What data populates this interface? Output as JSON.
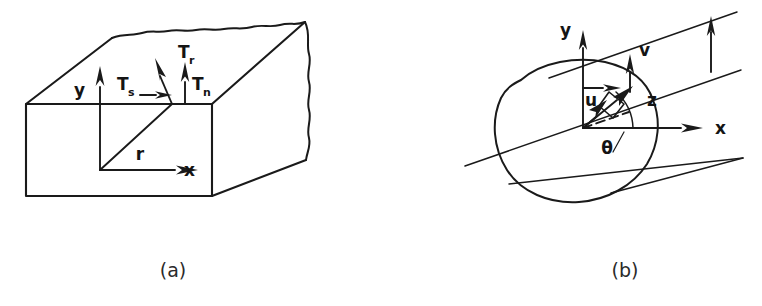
{
  "figure": {
    "background_color": "#ffffff",
    "ink_color": "#1a1a1a",
    "width": 762,
    "height": 306
  },
  "panels": [
    {
      "id": "a",
      "caption": "(a)",
      "description": "rectangular solid block with traction vector decomposition on top face",
      "labels": {
        "y_axis": "y",
        "x_axis": "x",
        "radius": "r",
        "traction_shear": "T",
        "traction_shear_sub": "s",
        "traction_resultant": "T",
        "traction_resultant_sub": "r",
        "traction_normal": "T",
        "traction_normal_sub": "n"
      }
    },
    {
      "id": "b",
      "caption": "(b)",
      "description": "irregular closed cross-section with inclined parallel lines and velocity vector decomposition",
      "labels": {
        "y_axis": "y",
        "x_axis": "x",
        "velocity_u": "u",
        "velocity_v": "v",
        "axis_z": "z",
        "angle_theta": "θ"
      }
    }
  ]
}
